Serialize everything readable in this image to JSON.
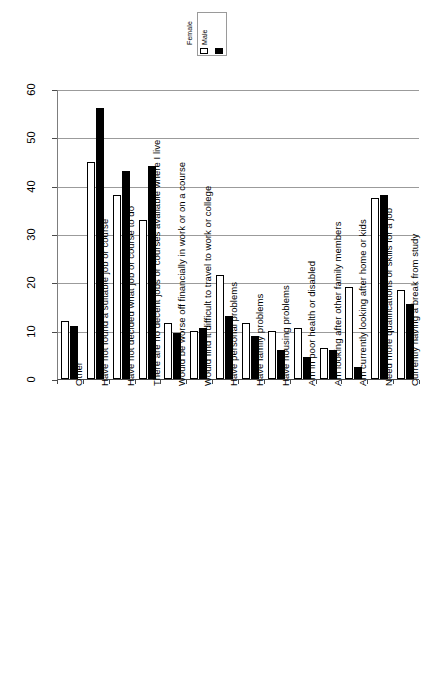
{
  "chart_data": {
    "type": "bar",
    "title": "",
    "subtitle": "",
    "xlabel": "",
    "ylabel": "",
    "ylim": [
      0,
      60
    ],
    "yticks": [
      0,
      10,
      20,
      30,
      40,
      50,
      60
    ],
    "grid": true,
    "orientation": "vertical",
    "legend_position": "top-center",
    "categories": [
      "Other",
      "Have not found a suitable job or course",
      "Have not decided what job or course to do",
      "There are no decent jobs or courses available where I live",
      "Would be worse off financially in work or on a course",
      "Would find it difficult to travel to work or college",
      "Have personal problems",
      "Have family problems",
      "Have housing problems",
      "Am in poor health or disabled",
      "Am looking after other family members",
      "Am currently looking after home or kids",
      "Need more qualifications or skills for a job",
      "Currently having a break from study"
    ],
    "series": [
      {
        "name": "Female",
        "color": "#ffffff",
        "values": [
          12,
          45,
          38,
          33,
          11.5,
          10,
          21.5,
          11.5,
          10,
          10.5,
          6.5,
          19,
          37.5,
          18.5
        ]
      },
      {
        "name": "Male",
        "color": "#000000",
        "values": [
          11,
          56,
          43,
          44,
          9.5,
          10.5,
          13,
          9,
          6,
          4.5,
          6,
          2.5,
          38,
          15.5
        ]
      }
    ]
  },
  "legend": {
    "entries": [
      {
        "label": "Female",
        "swatch": "female"
      },
      {
        "label": "Male",
        "swatch": "male"
      }
    ]
  }
}
